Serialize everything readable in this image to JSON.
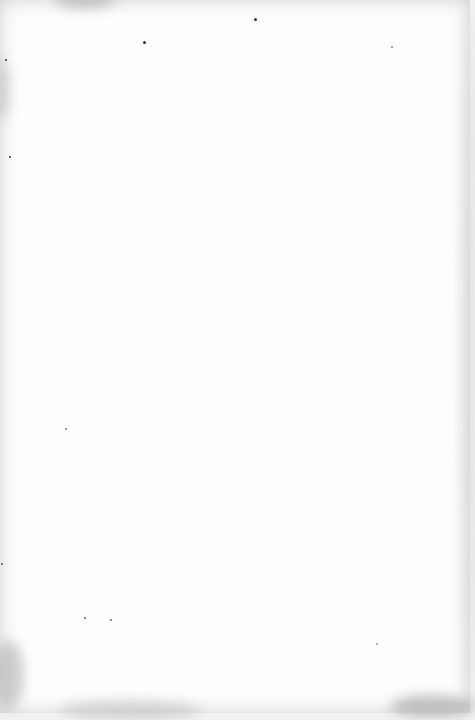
{
  "document": {
    "type": "blank-scanned-page",
    "description": "Blank page"
  }
}
